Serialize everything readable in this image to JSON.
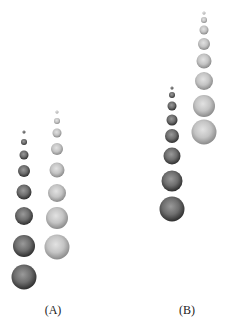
{
  "figure": {
    "width": 225,
    "height": 331,
    "background": "#ffffff",
    "panels": [
      {
        "id": "A",
        "label": "(A)",
        "label_pos": [
          53,
          310
        ],
        "columns": [
          {
            "name": "dark",
            "tone": "dark",
            "cx": 24,
            "spheres": [
              {
                "cy": 132,
                "r": 1.5
              },
              {
                "cy": 142,
                "r": 3
              },
              {
                "cy": 155,
                "r": 4.5
              },
              {
                "cy": 171,
                "r": 6
              },
              {
                "cy": 192,
                "r": 7.5
              },
              {
                "cy": 216,
                "r": 9
              },
              {
                "cy": 246,
                "r": 11
              },
              {
                "cy": 277,
                "r": 12.5
              }
            ]
          },
          {
            "name": "light",
            "tone": "light",
            "cx": 57,
            "spheres": [
              {
                "cy": 112,
                "r": 1.5
              },
              {
                "cy": 121,
                "r": 3
              },
              {
                "cy": 133,
                "r": 4.5
              },
              {
                "cy": 149,
                "r": 6
              },
              {
                "cy": 170,
                "r": 7.5
              },
              {
                "cy": 193,
                "r": 9
              },
              {
                "cy": 218,
                "r": 11
              },
              {
                "cy": 247,
                "r": 12.5
              }
            ]
          }
        ]
      },
      {
        "id": "B",
        "label": "(B)",
        "label_pos": [
          187,
          310
        ],
        "columns": [
          {
            "name": "dark",
            "tone": "dark",
            "cx": 172,
            "spheres": [
              {
                "cy": 88,
                "r": 1.5
              },
              {
                "cy": 95,
                "r": 3
              },
              {
                "cy": 106,
                "r": 4.5
              },
              {
                "cy": 120,
                "r": 5.5
              },
              {
                "cy": 136,
                "r": 7
              },
              {
                "cy": 156,
                "r": 8.5
              },
              {
                "cy": 181,
                "r": 10.5
              },
              {
                "cy": 209,
                "r": 12.5
              }
            ]
          },
          {
            "name": "light",
            "tone": "light",
            "cx": 204,
            "spheres": [
              {
                "cy": 13,
                "r": 1.5
              },
              {
                "cy": 20,
                "r": 3
              },
              {
                "cy": 30,
                "r": 4.5
              },
              {
                "cy": 44,
                "r": 6
              },
              {
                "cy": 61,
                "r": 7.5
              },
              {
                "cy": 81,
                "r": 9
              },
              {
                "cy": 106,
                "r": 11
              },
              {
                "cy": 132,
                "r": 12.5
              }
            ]
          }
        ]
      }
    ],
    "tones": {
      "dark": {
        "highlight": "#9a9a9a",
        "mid": "#6e6e6e",
        "edge": "#2e2e2e"
      },
      "light": {
        "highlight": "#e2e2e2",
        "mid": "#c4c4c4",
        "edge": "#8a8a8a"
      }
    }
  }
}
